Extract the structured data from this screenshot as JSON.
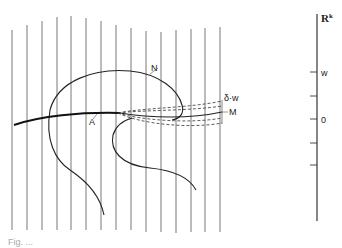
{
  "diagram": {
    "labels": {
      "N": "N",
      "A": "A",
      "M": "M",
      "delta_w": "δ·w",
      "axis_title": "R",
      "axis_superscript": "k",
      "tick_w": "w",
      "tick_0": "0"
    },
    "caption": "Fig. ..."
  }
}
